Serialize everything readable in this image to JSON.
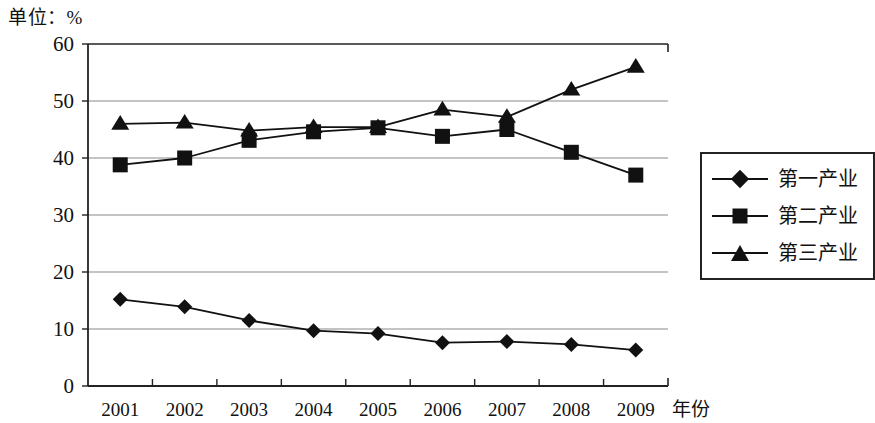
{
  "caption": {
    "unit_label": "单位：%"
  },
  "axes": {
    "x_title": "年份",
    "y_ticks": [
      "60",
      "50",
      "40",
      "30",
      "20",
      "10",
      "0"
    ],
    "x_ticks": [
      "2001",
      "2002",
      "2003",
      "2004",
      "2005",
      "2006",
      "2007",
      "2008",
      "2009"
    ]
  },
  "legend": {
    "items": [
      {
        "label": "第一产业",
        "marker": "diamond-marker-icon",
        "color": "#111111"
      },
      {
        "label": "第二产业",
        "marker": "square-marker-icon",
        "color": "#111111"
      },
      {
        "label": "第三产业",
        "marker": "triangle-marker-icon",
        "color": "#111111"
      }
    ]
  },
  "colors": {
    "line": "#111111",
    "grid": "#8a8a8a",
    "axis": "#222222",
    "background": "#ffffff"
  },
  "chart_data": {
    "type": "line",
    "title": "单位：%",
    "xlabel": "年份",
    "ylabel": "",
    "categories": [
      "2001",
      "2002",
      "2003",
      "2004",
      "2005",
      "2006",
      "2007",
      "2008",
      "2009"
    ],
    "ylim": [
      0,
      60
    ],
    "ytick_step": 10,
    "grid": true,
    "legend_position": "right",
    "series": [
      {
        "name": "第一产业",
        "marker": "diamond",
        "values": [
          15.2,
          13.9,
          11.5,
          9.7,
          9.2,
          7.6,
          7.8,
          7.3,
          6.3
        ]
      },
      {
        "name": "第二产业",
        "marker": "square",
        "values": [
          38.8,
          40.0,
          43.1,
          44.6,
          45.3,
          43.8,
          45.0,
          41.0,
          37.0
        ]
      },
      {
        "name": "第三产业",
        "marker": "triangle",
        "values": [
          46.0,
          46.2,
          44.8,
          45.4,
          45.4,
          48.5,
          47.2,
          52.0,
          56.0
        ]
      }
    ]
  }
}
